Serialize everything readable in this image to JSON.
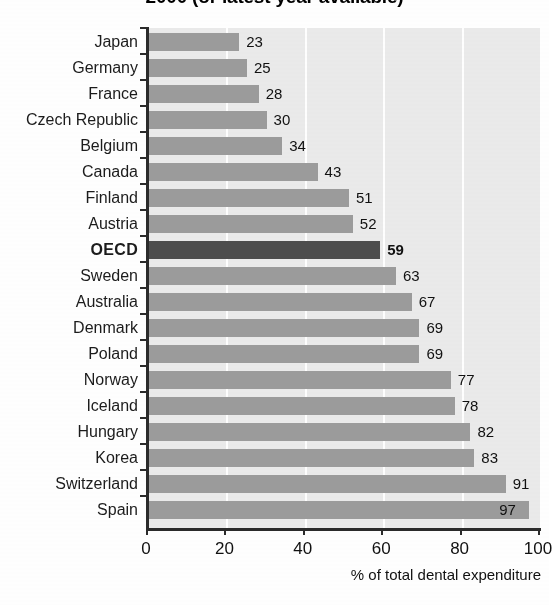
{
  "chart_data": {
    "type": "bar",
    "orientation": "horizontal",
    "title": "2000 (or latest year available)",
    "xlabel": "% of total dental expenditure",
    "ylabel": "",
    "xlim": [
      0,
      100
    ],
    "xticks": [
      0,
      20,
      40,
      60,
      80,
      100
    ],
    "xtick_labels": [
      "0",
      "20",
      "40",
      "60",
      "80",
      "100"
    ],
    "grid": "vertical-white-gridlines",
    "legend": "none",
    "categories": [
      "Japan",
      "Germany",
      "France",
      "Czech Republic",
      "Belgium",
      "Canada",
      "Finland",
      "Austria",
      "OECD",
      "Sweden",
      "Australia",
      "Denmark",
      "Poland",
      "Norway",
      "Iceland",
      "Hungary",
      "Korea",
      "Switzerland",
      "Spain"
    ],
    "values": [
      23,
      25,
      28,
      30,
      34,
      43,
      51,
      52,
      59,
      63,
      67,
      69,
      69,
      77,
      78,
      82,
      83,
      91,
      97
    ],
    "highlight_category": "OECD",
    "colors": {
      "bar": "#9c9c9c",
      "bar_highlight": "#4d4d4d",
      "plot_background": "#ebebeb",
      "gridline": "#ffffff",
      "axis": "#2b2b2b",
      "text": "#1a1a1a"
    }
  }
}
